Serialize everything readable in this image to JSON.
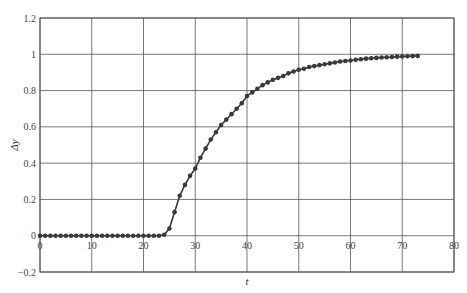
{
  "chart_data": {
    "type": "line",
    "title": "",
    "xlabel": "t",
    "ylabel": "Δy",
    "xlim": [
      0,
      80
    ],
    "ylim": [
      -0.2,
      1.2
    ],
    "grid": true,
    "legend": null,
    "x_ticks": [
      "0",
      "10",
      "20",
      "30",
      "40",
      "50",
      "60",
      "70",
      "80"
    ],
    "y_ticks": [
      "-0.2",
      "0",
      "0.2",
      "0.4",
      "0.6",
      "0.8",
      "1",
      "1.2"
    ],
    "series": [
      {
        "name": "response",
        "marker": "circle",
        "color": "#3a3a3a",
        "x": [
          0,
          1,
          2,
          3,
          4,
          5,
          6,
          7,
          8,
          9,
          10,
          11,
          12,
          13,
          14,
          15,
          16,
          17,
          18,
          19,
          20,
          21,
          22,
          23,
          24,
          25,
          26,
          27,
          28,
          29,
          30,
          31,
          32,
          33,
          34,
          35,
          36,
          37,
          38,
          39,
          40,
          41,
          42,
          43,
          44,
          45,
          46,
          47,
          48,
          49,
          50,
          51,
          52,
          53,
          54,
          55,
          56,
          57,
          58,
          59,
          60,
          61,
          62,
          63,
          64,
          65,
          66,
          67,
          68,
          69,
          70,
          71,
          72,
          73
        ],
        "values": [
          0,
          0,
          0,
          0,
          0,
          0,
          0,
          0,
          0,
          0,
          0,
          0,
          0,
          0,
          0,
          0,
          0,
          0,
          0,
          0,
          0,
          0,
          0,
          0,
          0.005,
          0.04,
          0.13,
          0.22,
          0.28,
          0.33,
          0.37,
          0.43,
          0.48,
          0.53,
          0.57,
          0.61,
          0.64,
          0.67,
          0.7,
          0.73,
          0.77,
          0.79,
          0.81,
          0.83,
          0.845,
          0.86,
          0.87,
          0.88,
          0.895,
          0.905,
          0.915,
          0.92,
          0.93,
          0.935,
          0.94,
          0.945,
          0.95,
          0.955,
          0.96,
          0.963,
          0.966,
          0.97,
          0.973,
          0.976,
          0.978,
          0.98,
          0.982,
          0.984,
          0.985,
          0.987,
          0.988,
          0.989,
          0.99,
          0.991
        ]
      }
    ]
  }
}
